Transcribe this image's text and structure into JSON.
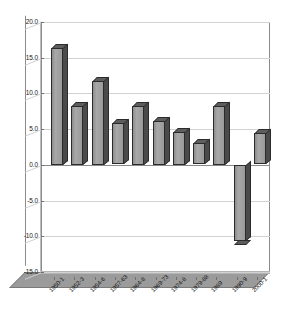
{
  "chart_data": {
    "type": "bar",
    "title": "",
    "subtitle": "",
    "xlabel": "",
    "ylabel": "",
    "ylim": [
      -15.0,
      20.0
    ],
    "ytick_step": 5.0,
    "grid": true,
    "legend": false,
    "legend_position": "none",
    "style": "3d-column",
    "bar_color": "#9a9a9a",
    "bar_edge_color": "#2b2b2b",
    "plot_background": "#ffffff",
    "floor_color": "#9b9b9b",
    "gridline_color": "#d2d2d2",
    "categories": [
      "1950-1",
      "1952-3",
      "1954-6",
      "1957-63",
      "1964-8",
      "1969-73",
      "1974-8",
      "1979-88",
      "1989",
      "1990-9",
      "2000-1"
    ],
    "values": [
      16.4,
      8.3,
      11.8,
      5.8,
      8.2,
      6.2,
      4.6,
      3.0,
      8.2,
      -10.7,
      4.4
    ],
    "ytick_labels": [
      "20.0",
      "15.0",
      "10.0",
      "5.0",
      "0.0",
      "-5.0",
      "-10.0",
      "-15.0"
    ],
    "ytick_values": [
      20.0,
      15.0,
      10.0,
      5.0,
      0.0,
      -5.0,
      -10.0,
      -15.0
    ],
    "series": [
      {
        "name": "",
        "values": [
          16.4,
          8.3,
          11.8,
          5.8,
          8.2,
          6.2,
          4.6,
          3.0,
          8.2,
          -10.7,
          4.4
        ]
      }
    ]
  }
}
